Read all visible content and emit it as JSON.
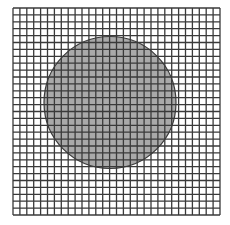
{
  "diagram": {
    "type": "grid-with-circle",
    "grid": {
      "x": 13,
      "y": 8,
      "width": 207,
      "height": 207,
      "columns": 30,
      "rows": 30,
      "line_color": "#3a3a3a",
      "line_width": 1.3,
      "background": "#ffffff"
    },
    "circle": {
      "cx": 110,
      "cy": 102.5,
      "r": 66,
      "fill": "#a9a9a9",
      "stroke": "#3a3a3a",
      "stroke_width": 1.2
    }
  }
}
